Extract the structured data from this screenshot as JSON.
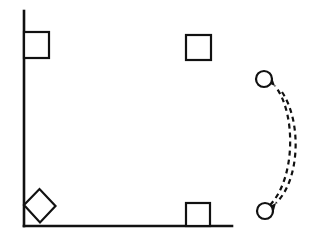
{
  "canvas": {
    "width": 319,
    "height": 244,
    "background": "#ffffff",
    "stroke_color": "#111111"
  },
  "diagram": {
    "axes": {
      "name": "corner-frame",
      "description": "L-shaped right angle formed by one vertical and one horizontal line",
      "vertical_line": {
        "x": 24,
        "y1": 11,
        "y2": 226,
        "stroke_width": 2.6
      },
      "horizontal_line": {
        "y": 226,
        "x1": 24,
        "x2": 232,
        "stroke_width": 2.6
      },
      "corner_point": {
        "x": 24,
        "y": 226
      }
    },
    "squares": [
      {
        "name": "top-left-square",
        "label": "",
        "x": 24,
        "y": 32,
        "width": 25,
        "height": 26,
        "rotation": 0,
        "attached_to": "vertical-line",
        "stroke_width": 2.2,
        "fill": "#ffffff"
      },
      {
        "name": "top-right-square",
        "label": "",
        "x": 186,
        "y": 35,
        "width": 25,
        "height": 25,
        "rotation": 0,
        "attached_to": "none",
        "stroke_width": 2.2,
        "fill": "#ffffff"
      },
      {
        "name": "bottom-right-square",
        "label": "",
        "x": 186,
        "y": 203,
        "width": 24,
        "height": 23,
        "rotation": 0,
        "attached_to": "horizontal-line",
        "stroke_width": 2.2,
        "fill": "#ffffff"
      }
    ],
    "rotated_square": {
      "name": "corner-rotated-square",
      "label": "",
      "rotation_deg": 45,
      "attached_to": "corner-point",
      "stroke_width": 2.2,
      "fill": "#ffffff",
      "points": [
        {
          "x": 24,
          "y": 205
        },
        {
          "x": 39.5,
          "y": 189
        },
        {
          "x": 55.5,
          "y": 206
        },
        {
          "x": 40,
          "y": 222.5
        }
      ]
    },
    "circles": [
      {
        "name": "top-circle",
        "label": "",
        "cx": 264,
        "cy": 79,
        "r": 8,
        "stroke_width": 2.2,
        "fill": "#ffffff"
      },
      {
        "name": "bottom-circle",
        "label": "",
        "cx": 265,
        "cy": 211,
        "r": 8,
        "stroke_width": 2.2,
        "fill": "#ffffff"
      }
    ],
    "arrows": [
      {
        "name": "arrow-up-to-top-circle",
        "direction": "bottom-to-top",
        "style": "dashed-curved",
        "dash_pattern": "5,4",
        "stroke_width": 2.2,
        "path": "M 270 205 C 296 178, 296 112, 275 86",
        "arrowhead_at": {
          "x": 275,
          "y": 86
        },
        "arrowhead_angle_deg": -130
      },
      {
        "name": "arrow-down-to-bottom-circle",
        "direction": "top-to-bottom",
        "style": "dashed-curved",
        "dash_pattern": "5,4",
        "stroke_width": 2.2,
        "path": "M 282 92 C 302 122, 300 180, 276 203",
        "arrowhead_at": {
          "x": 276,
          "y": 203
        },
        "arrowhead_angle_deg": 132
      }
    ]
  }
}
